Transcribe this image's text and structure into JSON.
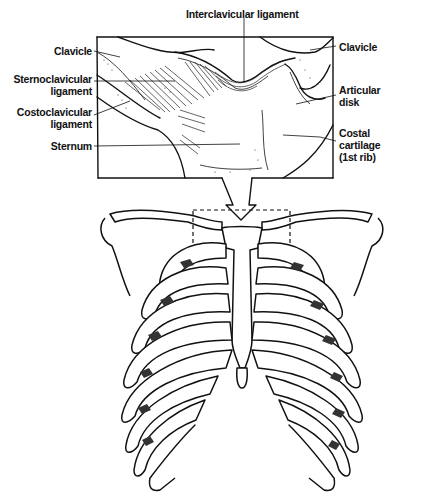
{
  "figure": {
    "inset": {
      "labels_left": [
        {
          "id": "clavicle-left",
          "text": "Clavicle"
        },
        {
          "id": "sternoclavicular-ligament",
          "text": "Sternoclavicular\nligament",
          "line1": "Sternoclavicular",
          "line2": "ligament"
        },
        {
          "id": "costoclavicular-ligament",
          "text": "Costoclavicular\nligament",
          "line1": "Costoclavicular",
          "line2": "ligament"
        },
        {
          "id": "sternum",
          "text": "Sternum"
        }
      ],
      "labels_top": [
        {
          "id": "interclavicular-ligament",
          "text": "Interclavicular ligament"
        }
      ],
      "labels_right": [
        {
          "id": "clavicle-right",
          "text": "Clavicle"
        },
        {
          "id": "articular-disk",
          "text": "Articular\ndisk",
          "line1": "Articular",
          "line2": "disk"
        },
        {
          "id": "costal-cartilage",
          "text": "Costal\ncartilage\n(1st rib)",
          "line1": "Costal",
          "line2": "cartilage",
          "line3": "(1st rib)"
        }
      ]
    },
    "main": {
      "description": "Anterior view of rib cage with dashed box highlighting the sternoclavicular region, connected to the magnified inset by a funnel arrow"
    }
  }
}
